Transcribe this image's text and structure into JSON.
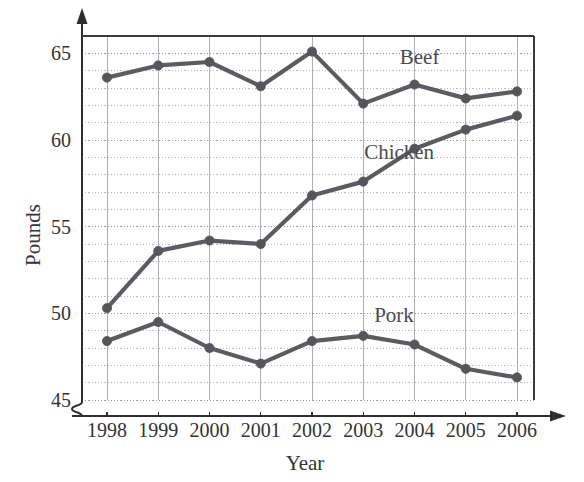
{
  "chart_data": {
    "type": "line",
    "title": "",
    "xlabel": "Year",
    "ylabel": "Pounds",
    "categories": [
      "1998",
      "1999",
      "2000",
      "2001",
      "2002",
      "2003",
      "2004",
      "2005",
      "2006"
    ],
    "x": [
      1998,
      1999,
      2000,
      2001,
      2002,
      2003,
      2004,
      2005,
      2006
    ],
    "ylim": [
      45,
      66
    ],
    "xlim": [
      1997.5,
      2006.8
    ],
    "y_ticks": [
      45,
      50,
      55,
      60,
      65
    ],
    "y_tick_labels": [
      "45",
      "50",
      "55",
      "60",
      "65"
    ],
    "y_minor_step": 1,
    "grid": "both-dotted",
    "axis_break": true,
    "legend_position": "inline-labels",
    "series": [
      {
        "name": "Beef",
        "label": "Beef",
        "color": "#5b5b64",
        "values": [
          63.6,
          64.3,
          64.5,
          63.1,
          65.1,
          62.1,
          63.2,
          62.4,
          62.8
        ],
        "label_x": 2004.1,
        "label_y": 64.4
      },
      {
        "name": "Chicken",
        "label": "Chicken",
        "color": "#5b5b64",
        "values": [
          50.3,
          53.6,
          54.2,
          54.0,
          56.8,
          57.6,
          59.5,
          60.6,
          61.4
        ],
        "label_x": 2003.7,
        "label_y": 58.9
      },
      {
        "name": "Pork",
        "label": "Pork",
        "color": "#5b5b64",
        "values": [
          48.4,
          49.5,
          48.0,
          47.1,
          48.4,
          48.7,
          48.2,
          46.8,
          46.3
        ],
        "label_x": 2003.6,
        "label_y": 49.5
      }
    ]
  },
  "axes": {
    "y_axis_title": "Pounds",
    "x_axis_title": "Year",
    "y_tick_labels": [
      "45",
      "50",
      "55",
      "60",
      "65"
    ],
    "x_tick_labels": [
      "1998",
      "1999",
      "2000",
      "2001",
      "2002",
      "2003",
      "2004",
      "2005",
      "2006"
    ]
  },
  "series_labels": {
    "beef": "Beef",
    "chicken": "Chicken",
    "pork": "Pork"
  },
  "colors": {
    "line": "#5b5b64",
    "marker": "#55555e",
    "axis": "#2e2e2e",
    "grid_minor": "#b9b9c4",
    "grid_major": "#9a9aa6",
    "text": "#333338"
  }
}
